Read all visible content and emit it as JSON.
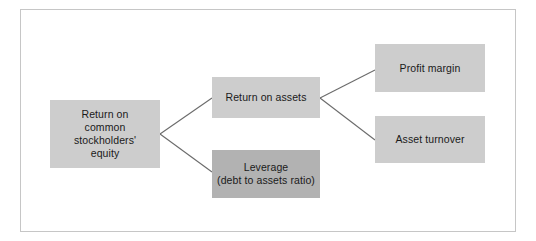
{
  "diagram": {
    "type": "tree",
    "orientation": "left-to-right",
    "frame": {
      "border_color": "#c6c6c6",
      "background_color": "#ffffff"
    },
    "palette": {
      "node_fill_light": "#cdcdcd",
      "node_fill_dark": "#b2b2b2",
      "connector_color": "#6b6b6b",
      "text_color": "#1a1a1a"
    },
    "nodes": [
      {
        "id": "roce",
        "label": "Return on\ncommon\nstockholders'\nequity",
        "level": 0,
        "fill": "#cdcdcd"
      },
      {
        "id": "roa",
        "label": "Return on assets",
        "level": 1,
        "fill": "#cdcdcd"
      },
      {
        "id": "leverage",
        "label": "Leverage\n(debt to assets ratio)",
        "level": 1,
        "fill": "#b2b2b2"
      },
      {
        "id": "profit_margin",
        "label": "Profit margin",
        "level": 2,
        "fill": "#cdcdcd"
      },
      {
        "id": "asset_turnover",
        "label": "Asset turnover",
        "level": 2,
        "fill": "#cdcdcd"
      }
    ],
    "edges": [
      {
        "from": "roce",
        "to": "roa"
      },
      {
        "from": "roce",
        "to": "leverage"
      },
      {
        "from": "roa",
        "to": "profit_margin"
      },
      {
        "from": "roa",
        "to": "asset_turnover"
      }
    ]
  }
}
